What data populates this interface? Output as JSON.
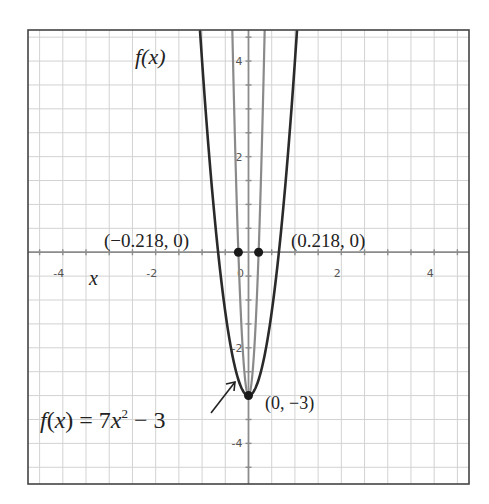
{
  "chart_data": {
    "type": "line",
    "title": "",
    "xlabel": "x",
    "ylabel": "f(x)",
    "xlim": [
      -4.75,
      4.75
    ],
    "ylim": [
      -4.85,
      4.65
    ],
    "grid": true,
    "grid_step": 0.5,
    "x_ticks": [
      -4,
      -2,
      0,
      2,
      4
    ],
    "x_tick_labels": [
      "-4",
      "-2",
      "0",
      "2",
      "4"
    ],
    "y_ticks": [
      -4,
      -2,
      2,
      4
    ],
    "y_tick_labels": [
      "-4",
      "-2",
      "2",
      "4"
    ],
    "series": [
      {
        "name": "f(x) = 7x² − 3",
        "a": 7,
        "c": -3,
        "color": "#2a2a2a",
        "width": 2.6
      },
      {
        "name": "inner parabola",
        "a": 63,
        "c": -3,
        "color": "#8a8a8a",
        "width": 2.2
      }
    ],
    "points": [
      {
        "x": -0.218,
        "y": 0,
        "label": "(−0.218, 0)"
      },
      {
        "x": 0.218,
        "y": 0,
        "label": "(0.218, 0)"
      },
      {
        "x": 0,
        "y": -3,
        "label": "(0, −3)"
      }
    ],
    "annotations": [
      {
        "text": "f(x) = 7x² − 3",
        "arrow_to": [
          -0.25,
          -2.55
        ]
      },
      {
        "text": "f(x)",
        "role": "y-axis label"
      },
      {
        "text": "x",
        "role": "x-axis label"
      }
    ]
  },
  "labels": {
    "y_axis": "f(x)",
    "x_axis": "x",
    "root_left": "(−0.218, 0)",
    "root_right": "(0.218, 0)",
    "vertex": "(0, −3)",
    "equation_prefix": "f(x) = 7",
    "equation_var": "x",
    "equation_exp": "2",
    "equation_suffix": " − 3"
  }
}
